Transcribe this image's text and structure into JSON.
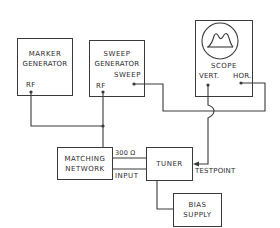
{
  "diagram": {
    "type": "block-diagram",
    "colors": {
      "line": "#3a3a3a",
      "text": "#2e2e2e",
      "background": "#ffffff"
    },
    "blocks": {
      "marker_generator": {
        "line1": "MARKER",
        "line2": "GENERATOR",
        "port_rf": "RF"
      },
      "sweep_generator": {
        "line1": "SWEEP",
        "line2": "GENERATOR",
        "port_sweep": "SWEEP",
        "port_rf": "RF"
      },
      "scope": {
        "label": "SCOPE",
        "port_vert": "VERT.",
        "port_hor": "HOR."
      },
      "matching_network": {
        "line1": "MATCHING",
        "line2": "NETWORK"
      },
      "tuner": {
        "label": "TUNER",
        "port_300": "300 Ω",
        "port_input": "INPUT",
        "port_testpoint": "TESTPOINT"
      },
      "bias_supply": {
        "line1": "BIAS",
        "line2": "SUPPLY"
      }
    },
    "connections": [
      {
        "from": "MARKER GENERATOR RF",
        "to": "SWEEP GENERATOR RF junction"
      },
      {
        "from": "SWEEP GENERATOR RF",
        "to": "MATCHING NETWORK"
      },
      {
        "from": "SWEEP GENERATOR SWEEP",
        "to": "SCOPE HOR."
      },
      {
        "from": "SCOPE VERT.",
        "to": "TUNER TESTPOINT"
      },
      {
        "from": "MATCHING NETWORK",
        "to": "TUNER 300 Ω"
      },
      {
        "from": "MATCHING NETWORK",
        "to": "TUNER INPUT"
      },
      {
        "from": "TUNER",
        "to": "BIAS SUPPLY"
      }
    ]
  }
}
